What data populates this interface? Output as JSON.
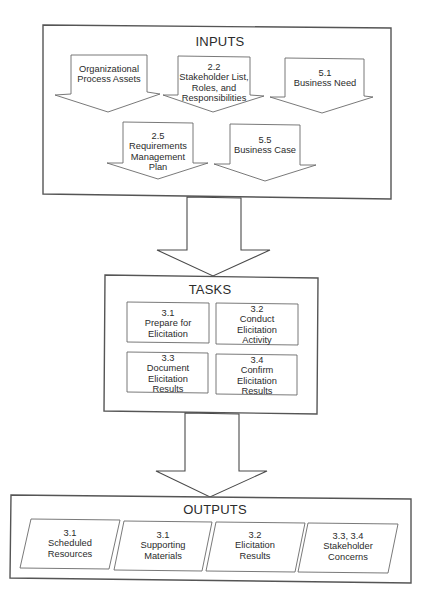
{
  "inputs": {
    "title": "INPUTS",
    "items": [
      {
        "id": "",
        "label": "Organizational\nProcess Assets"
      },
      {
        "id": "2.2",
        "label": "2.2\nStakeholder List,\nRoles, and\nResponsibilities"
      },
      {
        "id": "5.1",
        "label": "5.1\nBusiness Need"
      },
      {
        "id": "2.5",
        "label": "2.5\nRequirements\nManagement\nPlan"
      },
      {
        "id": "5.5",
        "label": "5.5\nBusiness Case"
      }
    ]
  },
  "tasks": {
    "title": "TASKS",
    "items": [
      {
        "id": "3.1",
        "label": "3.1\nPrepare for\nElicitation"
      },
      {
        "id": "3.2",
        "label": "3.2\nConduct\nElicitation\nActivity"
      },
      {
        "id": "3.3",
        "label": "3.3\nDocument\nElicitation\nResults"
      },
      {
        "id": "3.4",
        "label": "3.4\nConfirm\nElicitation\nResults"
      }
    ]
  },
  "outputs": {
    "title": "OUTPUTS",
    "items": [
      {
        "id": "3.1",
        "label": "3.1\nScheduled\nResources"
      },
      {
        "id": "3.1",
        "label": "3.1\nSupporting\nMaterials"
      },
      {
        "id": "3.2",
        "label": "3.2\nElicitation\nResults"
      },
      {
        "id": "3.3, 3.4",
        "label": "3.3, 3.4\nStakeholder\nConcerns"
      }
    ]
  },
  "colors": {
    "background": "#ffffff",
    "stroke": "#555555",
    "text": "#2b2b2b"
  }
}
